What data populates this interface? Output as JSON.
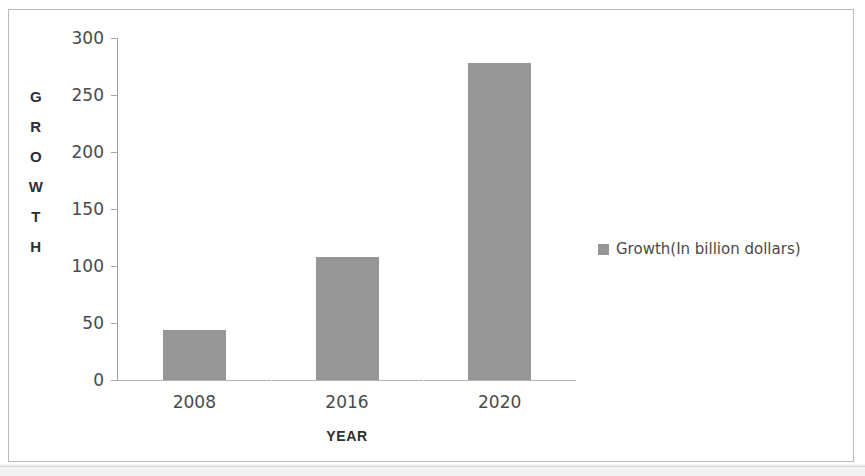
{
  "chart_data": {
    "type": "bar",
    "title": "",
    "categories": [
      "2008",
      "2016",
      "2020"
    ],
    "values": [
      44,
      108,
      278
    ],
    "series": [
      {
        "name": "Growth(In billion dollars)",
        "values": [
          44,
          108,
          278
        ]
      }
    ],
    "xlabel": "YEAR",
    "ylabel": "GROWTH",
    "ylim": [
      0,
      300
    ],
    "ytick_labels": [
      "300",
      "250",
      "200",
      "150",
      "100",
      "50",
      "0"
    ],
    "ytick_values": [
      300,
      250,
      200,
      150,
      100,
      50,
      0
    ],
    "grid": true,
    "legend": {
      "position": "right",
      "entries": [
        "Growth(In billion dollars)"
      ]
    },
    "colors": {
      "bar": "#969696",
      "text": "#4a4a4a",
      "axis": "#a8a8a8",
      "frame": "#b9b9b9"
    }
  },
  "axis": {
    "y_title_letters": [
      "G",
      "R",
      "O",
      "W",
      "T",
      "H"
    ]
  }
}
